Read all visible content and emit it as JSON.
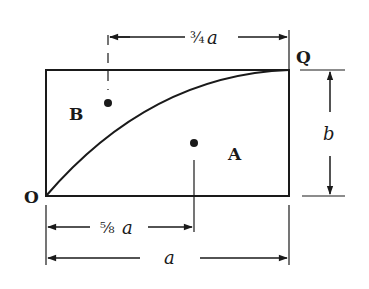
{
  "diagram": {
    "labels": {
      "origin": "O",
      "corner": "Q",
      "region_upper": "B",
      "region_lower": "A",
      "height": "b",
      "width": "a",
      "top_dim_frac": "¾",
      "top_dim_var": "a",
      "bottom_dim_frac": "⅝",
      "bottom_dim_var": "a"
    },
    "dimensions": {
      "top": "3/4 a",
      "bottom_inner": "5/8 a",
      "bottom_outer": "a",
      "right": "b"
    },
    "colors": {
      "ink": "#1a1a1a",
      "background": "#ffffff"
    }
  }
}
